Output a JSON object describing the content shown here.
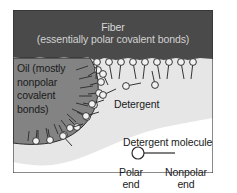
{
  "figure": {
    "name": "detergent-micelle-diagram",
    "width": 237,
    "height": 193
  },
  "colors": {
    "background": "#ffffff",
    "fiber_fill": "#4a4a4a",
    "fiber_text": "#d8d8d8",
    "oil_fill": "#838383",
    "water_fill": "#e6e6e6",
    "molecule_stroke": "#2b2b2b",
    "molecule_head_fill": "#f2f2f2",
    "text": "#1a1a1a"
  },
  "regions": {
    "fiber": {
      "title": "Fiber",
      "subtitle": "(essentially polar covalent bonds)"
    },
    "oil": {
      "label": "Oil (mostly\nnonpolar\ncovalent\nbonds)"
    },
    "detergent": {
      "label": "Detergent"
    }
  },
  "legend": {
    "title": "Detergent molecule",
    "polar_end": "Polar\nend",
    "nonpolar_end": "Nonpolar\nend"
  },
  "molecules": {
    "fiber_surface_row": [
      {
        "hx": 97,
        "hy": 62,
        "tx": 96,
        "ty": 79
      },
      {
        "hx": 109,
        "hy": 62,
        "tx": 112,
        "ty": 79
      },
      {
        "hx": 121,
        "hy": 62,
        "tx": 119,
        "ty": 79
      },
      {
        "hx": 133,
        "hy": 62,
        "tx": 136,
        "ty": 79
      },
      {
        "hx": 145,
        "hy": 62,
        "tx": 143,
        "ty": 79
      },
      {
        "hx": 157,
        "hy": 62,
        "tx": 160,
        "ty": 79
      },
      {
        "hx": 169,
        "hy": 62,
        "tx": 167,
        "ty": 79
      },
      {
        "hx": 181,
        "hy": 62,
        "tx": 184,
        "ty": 79
      },
      {
        "hx": 193,
        "hy": 62,
        "tx": 191,
        "ty": 79
      }
    ],
    "free_molecules": [
      {
        "hx": 103,
        "hy": 74,
        "tx": 108,
        "ty": 85
      },
      {
        "hx": 126,
        "hy": 86,
        "tx": 141,
        "ty": 83
      },
      {
        "hx": 155,
        "hy": 85,
        "tx": 152,
        "ty": 71
      },
      {
        "hx": 103,
        "hy": 95,
        "tx": 116,
        "ty": 89
      },
      {
        "hx": 92,
        "hy": 104,
        "tx": 104,
        "ty": 100
      },
      {
        "hx": 86,
        "hy": 116,
        "tx": 99,
        "ty": 112
      },
      {
        "hx": 70,
        "hy": 128,
        "tx": 83,
        "ty": 124
      },
      {
        "hx": 63,
        "hy": 136,
        "tx": 72,
        "ty": 146
      }
    ],
    "micelle_shell": [
      {
        "hx": 98,
        "hy": 70,
        "tx": 88,
        "ty": 76
      },
      {
        "hx": 101,
        "hy": 82,
        "tx": 90,
        "ty": 85
      },
      {
        "hx": 99,
        "hy": 93,
        "tx": 88,
        "ty": 94
      },
      {
        "hx": 94,
        "hy": 105,
        "tx": 83,
        "ty": 103
      },
      {
        "hx": 87,
        "hy": 117,
        "tx": 77,
        "ty": 112
      },
      {
        "hx": 77,
        "hy": 127,
        "tx": 69,
        "ty": 119
      },
      {
        "hx": 64,
        "hy": 135,
        "tx": 59,
        "ty": 125
      },
      {
        "hx": 50,
        "hy": 140,
        "tx": 48,
        "ty": 129
      },
      {
        "hx": 36,
        "hy": 141,
        "tx": 37,
        "ty": 130
      }
    ]
  }
}
